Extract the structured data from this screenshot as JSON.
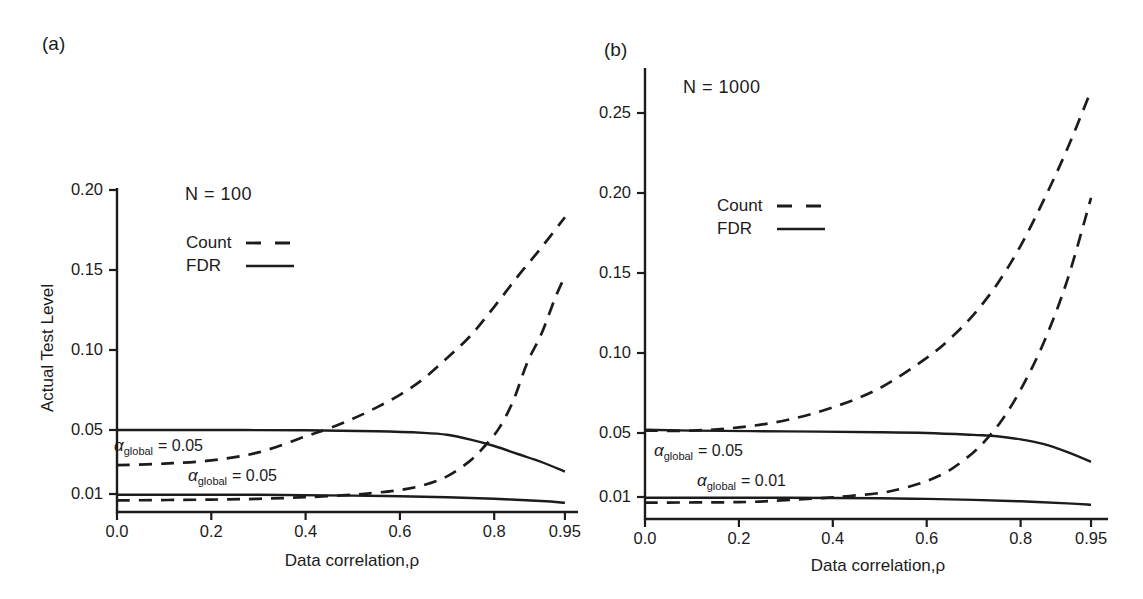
{
  "figure": {
    "background": "#ffffff",
    "ink_color": "#1c1c1c"
  },
  "chart_data": [
    {
      "type": "line",
      "panel_label": "(a)",
      "title": "N = 100",
      "xlabel": "Data correlation,ρ",
      "ylabel": "Actual Test Level",
      "xlim": [
        0.0,
        0.95
      ],
      "ylim": [
        0.0,
        0.21
      ],
      "grid": false,
      "legend_position": "upper-left-inside",
      "legend": [
        "Count",
        "FDR"
      ],
      "x_ticks": {
        "values": [
          0.0,
          0.2,
          0.4,
          0.6,
          0.8,
          0.95
        ],
        "labels": [
          "0.0",
          "0.2",
          "0.4",
          "0.6",
          "0.8",
          "0.95"
        ]
      },
      "y_ticks": {
        "values": [
          0.01,
          0.05,
          0.1,
          0.15,
          0.2
        ],
        "labels": [
          "0.01",
          "0.05",
          "0.10",
          "0.15",
          "0.20"
        ]
      },
      "annotations": [
        {
          "alpha": "α",
          "subscript": "global",
          "value": "= 0.05"
        },
        {
          "alpha": "α",
          "subscript": "global",
          "value": "= 0.05"
        }
      ],
      "series": [
        {
          "name": "Count, alpha_global = 0.05",
          "style": "dashed",
          "points": [
            [
              0,
              0.028
            ],
            [
              0.1,
              0.029
            ],
            [
              0.2,
              0.031
            ],
            [
              0.3,
              0.036
            ],
            [
              0.4,
              0.046
            ],
            [
              0.45,
              0.051
            ],
            [
              0.5,
              0.057
            ],
            [
              0.55,
              0.064
            ],
            [
              0.6,
              0.072
            ],
            [
              0.65,
              0.082
            ],
            [
              0.7,
              0.095
            ],
            [
              0.75,
              0.109
            ],
            [
              0.8,
              0.127
            ],
            [
              0.85,
              0.146
            ],
            [
              0.9,
              0.164
            ],
            [
              0.95,
              0.183
            ]
          ]
        },
        {
          "name": "FDR, alpha_global = 0.05",
          "style": "solid",
          "points": [
            [
              0,
              0.05
            ],
            [
              0.2,
              0.05
            ],
            [
              0.4,
              0.0498
            ],
            [
              0.55,
              0.0492
            ],
            [
              0.65,
              0.0482
            ],
            [
              0.7,
              0.047
            ],
            [
              0.75,
              0.044
            ],
            [
              0.8,
              0.04
            ],
            [
              0.85,
              0.035
            ],
            [
              0.9,
              0.03
            ],
            [
              0.95,
              0.024
            ]
          ]
        },
        {
          "name": "Count, alpha_global = 0.05 (lower pair)",
          "style": "dashed",
          "points": [
            [
              0,
              0.006
            ],
            [
              0.2,
              0.0065
            ],
            [
              0.3,
              0.007
            ],
            [
              0.4,
              0.008
            ],
            [
              0.5,
              0.0095
            ],
            [
              0.55,
              0.0108
            ],
            [
              0.6,
              0.0125
            ],
            [
              0.65,
              0.0155
            ],
            [
              0.7,
              0.021
            ],
            [
              0.75,
              0.031
            ],
            [
              0.78,
              0.04
            ],
            [
              0.81,
              0.051
            ],
            [
              0.84,
              0.068
            ],
            [
              0.87,
              0.092
            ],
            [
              0.9,
              0.11
            ],
            [
              0.93,
              0.133
            ],
            [
              0.95,
              0.146
            ]
          ]
        },
        {
          "name": "FDR, lower pair",
          "style": "solid",
          "points": [
            [
              0,
              0.0095
            ],
            [
              0.3,
              0.0095
            ],
            [
              0.5,
              0.009
            ],
            [
              0.6,
              0.0086
            ],
            [
              0.7,
              0.008
            ],
            [
              0.8,
              0.007
            ],
            [
              0.9,
              0.0056
            ],
            [
              0.95,
              0.0045
            ]
          ]
        }
      ]
    },
    {
      "type": "line",
      "panel_label": "(b)",
      "title": "N = 1000",
      "xlabel": "Data correlation,ρ",
      "xlim": [
        0.0,
        0.95
      ],
      "ylim": [
        0.0,
        0.28
      ],
      "grid": false,
      "legend_position": "upper-left-inside",
      "legend": [
        "Count",
        "FDR"
      ],
      "x_ticks": {
        "values": [
          0.0,
          0.2,
          0.4,
          0.6,
          0.8,
          0.95
        ],
        "labels": [
          "0.0",
          "0.2",
          "0.4",
          "0.6",
          "0.8",
          "0.95"
        ]
      },
      "y_ticks": {
        "values": [
          0.01,
          0.05,
          0.1,
          0.15,
          0.2,
          0.25
        ],
        "labels": [
          "0.01",
          "0.05",
          "0.10",
          "0.15",
          "0.20",
          "0.25"
        ]
      },
      "annotations": [
        {
          "alpha": "α",
          "subscript": "global",
          "value": "= 0.05"
        },
        {
          "alpha": "α",
          "subscript": "global",
          "value": "= 0.01"
        }
      ],
      "series": [
        {
          "name": "Count, alpha_global = 0.05",
          "style": "dashed",
          "points": [
            [
              0,
              0.0515
            ],
            [
              0.1,
              0.0515
            ],
            [
              0.2,
              0.0535
            ],
            [
              0.3,
              0.058
            ],
            [
              0.4,
              0.066
            ],
            [
              0.5,
              0.078
            ],
            [
              0.6,
              0.097
            ],
            [
              0.65,
              0.109
            ],
            [
              0.7,
              0.124
            ],
            [
              0.75,
              0.143
            ],
            [
              0.8,
              0.167
            ],
            [
              0.85,
              0.196
            ],
            [
              0.9,
              0.228
            ],
            [
              0.95,
              0.264
            ]
          ]
        },
        {
          "name": "FDR, alpha_global = 0.05",
          "style": "solid",
          "points": [
            [
              0,
              0.052
            ],
            [
              0.1,
              0.0515
            ],
            [
              0.3,
              0.051
            ],
            [
              0.5,
              0.0505
            ],
            [
              0.6,
              0.05
            ],
            [
              0.7,
              0.0488
            ],
            [
              0.75,
              0.048
            ],
            [
              0.8,
              0.046
            ],
            [
              0.85,
              0.043
            ],
            [
              0.9,
              0.038
            ],
            [
              0.95,
              0.032
            ]
          ]
        },
        {
          "name": "Count, alpha_global = 0.01",
          "style": "dashed",
          "points": [
            [
              0,
              0.0065
            ],
            [
              0.2,
              0.0068
            ],
            [
              0.3,
              0.008
            ],
            [
              0.4,
              0.0098
            ],
            [
              0.5,
              0.0125
            ],
            [
              0.55,
              0.0155
            ],
            [
              0.6,
              0.02
            ],
            [
              0.65,
              0.027
            ],
            [
              0.7,
              0.038
            ],
            [
              0.73,
              0.047
            ],
            [
              0.76,
              0.058
            ],
            [
              0.8,
              0.077
            ],
            [
              0.85,
              0.107
            ],
            [
              0.9,
              0.146
            ],
            [
              0.95,
              0.197
            ]
          ]
        },
        {
          "name": "FDR, alpha_global = 0.01",
          "style": "solid",
          "points": [
            [
              0,
              0.0095
            ],
            [
              0.3,
              0.0095
            ],
            [
              0.5,
              0.0092
            ],
            [
              0.6,
              0.0088
            ],
            [
              0.7,
              0.0082
            ],
            [
              0.8,
              0.0073
            ],
            [
              0.9,
              0.006
            ],
            [
              0.95,
              0.0052
            ]
          ]
        }
      ]
    }
  ]
}
